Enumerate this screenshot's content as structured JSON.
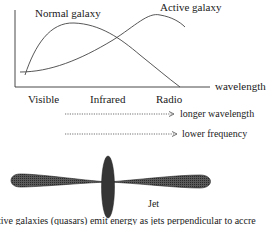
{
  "chart": {
    "curves": {
      "normal_label": "Normal galaxy",
      "active_label": "Active galaxy"
    },
    "axis": {
      "x_label": "wavelength",
      "ticks": [
        "Visible",
        "Infrared",
        "Radio"
      ]
    }
  },
  "arrows": [
    {
      "label": "longer wavelength"
    },
    {
      "label": "lower frequency"
    }
  ],
  "jet": {
    "label": "Jet"
  },
  "caption": "tive galaxies (quasars) emit energy as jets perpendicular to accre",
  "colors": {
    "ink": "#1a1a1a",
    "curve": "#444444",
    "jet_fill": "#3a3a3a"
  }
}
